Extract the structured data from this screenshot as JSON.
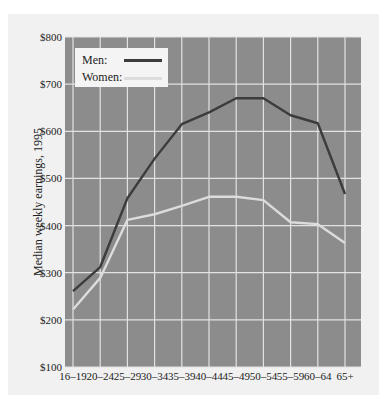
{
  "chart_data": {
    "type": "line",
    "title": "",
    "xlabel": "",
    "ylabel": "Median weekly earnings, 1995",
    "categories": [
      "16–19",
      "20–24",
      "25–29",
      "30–34",
      "35–39",
      "40–44",
      "45–49",
      "50–54",
      "55–59",
      "60–64",
      "65+"
    ],
    "series": [
      {
        "name": "Men:",
        "color": "#3c3c3c",
        "values": [
          261,
          312,
          458,
          542,
          615,
          640,
          670,
          670,
          634,
          617,
          467
        ]
      },
      {
        "name": "Women:",
        "color": "#dcdcdc",
        "values": [
          222,
          289,
          412,
          424,
          442,
          461,
          461,
          454,
          407,
          403,
          363
        ]
      }
    ],
    "yticks": [
      100,
      200,
      300,
      400,
      500,
      600,
      700,
      800
    ],
    "ytick_labels": [
      "$100",
      "$200",
      "$300",
      "$400",
      "$500",
      "$600",
      "$700",
      "$800"
    ],
    "ylim": [
      100,
      800
    ],
    "grid": true,
    "legend_position": "upper-left",
    "colors": {
      "plot_bg": "#8c8c8c",
      "grid": "#e2e2e2",
      "panel_bg": "#f1f1f1"
    }
  },
  "legend": {
    "items": [
      {
        "label": "Men:",
        "color": "#3c3c3c"
      },
      {
        "label": "Women:",
        "color": "#dcdcdc"
      }
    ]
  }
}
